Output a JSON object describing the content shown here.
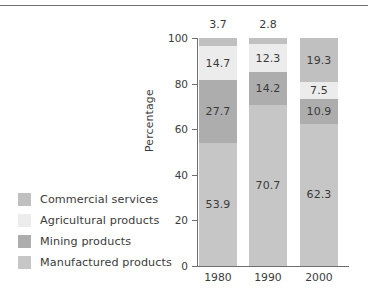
{
  "chart_data": {
    "type": "bar",
    "subtype": "stacked-bar-100",
    "title": "",
    "xlabel": "",
    "ylabel": "Percentage",
    "ylim": [
      0,
      100
    ],
    "yticks": [
      0,
      20,
      40,
      60,
      80,
      100
    ],
    "grid": false,
    "legend_position": "left",
    "categories": [
      "1980",
      "1990",
      "2000"
    ],
    "series": [
      {
        "name": "Manufactured products",
        "color": "#c6c6c6",
        "values": [
          53.9,
          70.7,
          62.3
        ],
        "labels": [
          "53.9",
          "70.7",
          "62.3"
        ]
      },
      {
        "name": "Mining products",
        "color": "#adadad",
        "values": [
          27.7,
          14.2,
          10.9
        ],
        "labels": [
          "27.7",
          "14.2",
          "10.9"
        ]
      },
      {
        "name": "Agricultural products",
        "color": "#ececec",
        "values": [
          14.7,
          12.3,
          7.5
        ],
        "labels": [
          "14.7",
          "12.3",
          "7.5"
        ]
      },
      {
        "name": "Commercial services",
        "color": "#c0c0c0",
        "values": [
          3.7,
          2.8,
          19.3
        ],
        "labels": [
          "3.7",
          "2.8",
          "19.3"
        ]
      }
    ],
    "outside_labels": [
      {
        "category": "1980",
        "text": "3.7"
      },
      {
        "category": "1990",
        "text": "2.8"
      }
    ]
  },
  "legend": {
    "items": [
      {
        "label": "Commercial services",
        "color": "#c0c0c0"
      },
      {
        "label": "Agricultural products",
        "color": "#ececec"
      },
      {
        "label": "Mining products",
        "color": "#adadad"
      },
      {
        "label": "Manufactured products",
        "color": "#c6c6c6"
      }
    ]
  },
  "axis": {
    "y_label": "Percentage",
    "y_ticks": [
      "100",
      "80",
      "60",
      "40",
      "20",
      "0"
    ],
    "x_ticks": [
      "1980",
      "1990",
      "2000"
    ]
  },
  "colors": {
    "axis": "#6f6f6f",
    "text": "#3b3b3b",
    "rule": "#6f6f6f"
  }
}
